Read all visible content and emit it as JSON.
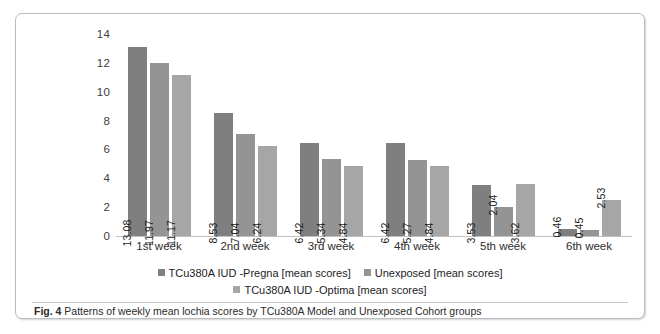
{
  "figure": {
    "caption_label": "Fig. 4",
    "caption_text": "Patterns of weekly mean lochia scores by TCu380A Model and Unexposed Cohort groups"
  },
  "legend": {
    "items": [
      {
        "label": "TCu380A IUD -Pregna [mean scores]",
        "color": "#7f7f7f",
        "swatch": "legend-swatch-series-1"
      },
      {
        "label": "Unexposed [mean scores]",
        "color": "#949494",
        "swatch": "legend-swatch-series-2"
      },
      {
        "label": "TCu380A IUD -Optima [mean scores]",
        "color": "#a6a6a6",
        "swatch": "legend-swatch-series-3"
      }
    ]
  },
  "chart_data": {
    "type": "bar",
    "title": "",
    "xlabel": "",
    "ylabel": "",
    "ylim": [
      0,
      14
    ],
    "yticks": [
      0,
      2,
      4,
      6,
      8,
      10,
      12,
      14
    ],
    "ytick_labels": [
      "0",
      "2",
      "4",
      "6",
      "8",
      "10",
      "12",
      "14"
    ],
    "grid": false,
    "legend_position": "bottom",
    "categories": [
      "1st week",
      "2nd week",
      "3rd week",
      "4th week",
      "5th week",
      "6th week"
    ],
    "series": [
      {
        "name": "TCu380A IUD -Pregna [mean scores]",
        "color": "#7f7f7f",
        "values": [
          13.08,
          8.53,
          6.42,
          6.42,
          3.53,
          0.46
        ],
        "labels": [
          "13.08",
          "8.53",
          "6.42",
          "6.42",
          "3.53",
          "0.46"
        ]
      },
      {
        "name": "Unexposed [mean scores]",
        "color": "#949494",
        "values": [
          11.97,
          7.04,
          5.34,
          5.27,
          2.04,
          0.45
        ],
        "labels": [
          "11.97",
          "7.04",
          "5.34",
          "5.27",
          "2.04",
          "0.45"
        ]
      },
      {
        "name": "TCu380A IUD -Optima [mean scores]",
        "color": "#a6a6a6",
        "values": [
          11.17,
          6.24,
          4.84,
          4.84,
          3.62,
          2.53
        ],
        "labels": [
          "11.17",
          "6.24",
          "4.84",
          "4.84",
          "3.62",
          "2.53"
        ]
      }
    ]
  }
}
